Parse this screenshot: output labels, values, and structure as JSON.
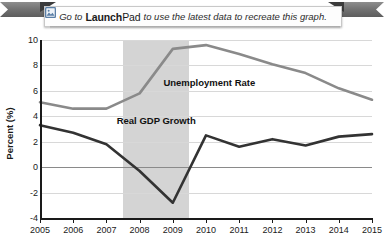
{
  "banner": {
    "lead_text": "Go to",
    "brand_bold": "Launch",
    "brand_light": "Pad",
    "trail_text": "to use the latest data to recreate this graph.",
    "icon_name": "launchpad-image-icon"
  },
  "chart_data": {
    "type": "line",
    "title": "",
    "xlabel": "",
    "ylabel": "Percent (%)",
    "x": [
      2005,
      2006,
      2007,
      2008,
      2009,
      2010,
      2011,
      2012,
      2013,
      2014,
      2015
    ],
    "xtick_labels": [
      "2005",
      "2006",
      "2007",
      "2008",
      "2009",
      "2010",
      "2011",
      "2012",
      "2013",
      "2014",
      "2015"
    ],
    "ytick_labels": [
      "10",
      "8",
      "6",
      "4",
      "2",
      "0",
      "-2",
      "-4"
    ],
    "ytick_values": [
      10,
      8,
      6,
      4,
      2,
      0,
      -2,
      -4
    ],
    "ylim": [
      -4,
      10
    ],
    "xlim": [
      2005,
      2015
    ],
    "grid": true,
    "legend": "inline-annotations",
    "series": [
      {
        "name": "Unemployment Rate",
        "color": "#8a8a8a",
        "values": [
          5.1,
          4.6,
          4.6,
          5.8,
          9.3,
          9.6,
          8.9,
          8.1,
          7.4,
          6.2,
          5.3
        ],
        "label_x": 2010.1,
        "label_y": 6.6
      },
      {
        "name": "Real GDP Growth",
        "color": "#333333",
        "values": [
          3.3,
          2.7,
          1.8,
          -0.3,
          -2.8,
          2.5,
          1.6,
          2.2,
          1.7,
          2.4,
          2.6
        ],
        "label_x": 2008.5,
        "label_y": 3.6
      }
    ],
    "annotations": [
      {
        "name": "recession-band",
        "type": "vspan",
        "x_start": 2007.5,
        "x_end": 2009.5,
        "color": "#d4d4d4"
      }
    ]
  }
}
